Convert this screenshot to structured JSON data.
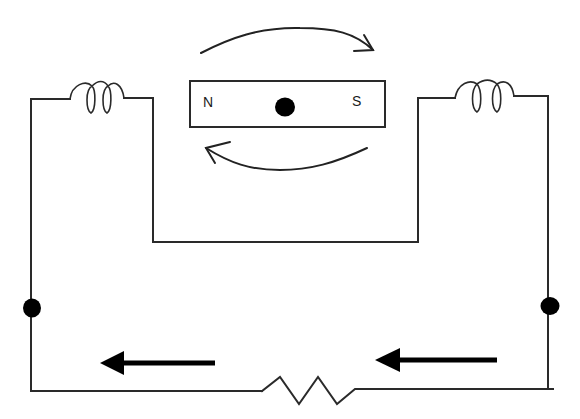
{
  "diagram": {
    "magnet": {
      "north_label": "N",
      "south_label": "S",
      "pivot": "center-dot"
    },
    "rotation_arrows": {
      "top": "clockwise-arrow-right",
      "bottom": "clockwise-arrow-left"
    },
    "components": {
      "left_coil": "inductor-coil-left",
      "right_coil": "inductor-coil-right",
      "resistor": "resistor-zigzag",
      "left_terminal": "junction-dot-left",
      "right_terminal": "junction-dot-right"
    },
    "current_arrows": {
      "left": "current-arrow-left",
      "right": "current-arrow-left"
    },
    "colors": {
      "line": "#2a2a2a",
      "fill": "#000000",
      "background": "#ffffff"
    }
  }
}
